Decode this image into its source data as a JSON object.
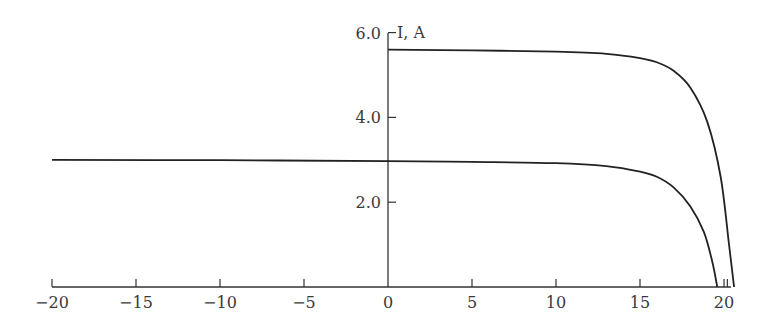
{
  "chart_data": {
    "type": "line",
    "title": "",
    "xlabel": "",
    "ylabel": "I, A",
    "xlim": [
      -20,
      20.8
    ],
    "ylim": [
      0,
      6.0
    ],
    "x_ticks": [
      "−20",
      "−15",
      "−10",
      "−5",
      "0",
      "5",
      "10",
      "15",
      "20"
    ],
    "y_ticks": [
      "2.0",
      "4.0",
      "6.0"
    ],
    "grid": false,
    "legend": "none",
    "series": [
      {
        "name": "upper curve",
        "x": [
          0,
          5,
          10,
          13,
          15,
          16,
          17,
          18,
          19,
          19.8,
          20.3,
          20.6
        ],
        "y": [
          5.6,
          5.58,
          5.55,
          5.5,
          5.4,
          5.3,
          5.1,
          4.7,
          3.9,
          2.6,
          1.0,
          0
        ]
      },
      {
        "name": "lower curve",
        "x": [
          -20,
          -10,
          0,
          5,
          10,
          13,
          15,
          16,
          17,
          18,
          18.8,
          19.3,
          19.6
        ],
        "y": [
          3.0,
          2.99,
          2.97,
          2.95,
          2.92,
          2.85,
          2.72,
          2.6,
          2.35,
          1.9,
          1.3,
          0.6,
          0
        ]
      }
    ]
  }
}
